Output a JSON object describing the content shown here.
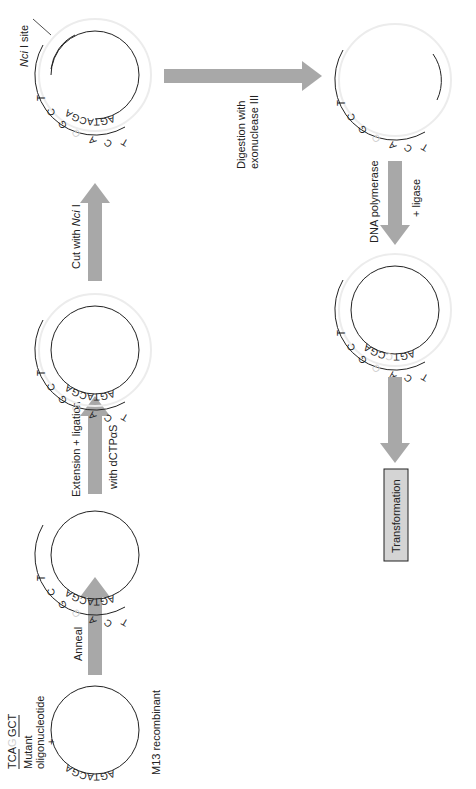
{
  "figure": {
    "type": "site-directed mutagenesis workflow",
    "orientation": "rotated 90deg counter-clockwise",
    "colors": {
      "arrow": "#a8a8a8",
      "strand": "#222222",
      "faded_strand": "#e2e2e2",
      "faded_base": "#cfcfcf",
      "box_fill": "#d4d4d4"
    }
  },
  "oligo": {
    "sequence_left": "TCA",
    "sequence_gap": "G",
    "sequence_right": "GCT",
    "label_line1": "Mutant",
    "label_line2": "oligonucleotide",
    "plus": "+"
  },
  "steps": [
    {
      "id": "m13",
      "template_seq": "AGTACGA",
      "caption": "M13 recombinant"
    },
    {
      "id": "annealed",
      "arrow_label": "Anneal",
      "top_seq": [
        "T",
        "C",
        "A",
        "G",
        "G",
        "C",
        "T"
      ],
      "template_seq": "AGTACGA"
    },
    {
      "id": "extended",
      "arrow_label_line1": "Extension + ligation",
      "arrow_label_line2": "with dCTPαS",
      "top_seq": [
        "T",
        "C",
        "A",
        "G",
        "G",
        "C",
        "T"
      ],
      "template_seq": "AGTACGA"
    },
    {
      "id": "nci-cut",
      "arrow_label_prefix": "Cut with ",
      "arrow_label_enzyme": "Nci",
      "arrow_label_suffix": " I",
      "top_seq": [
        "T",
        "C",
        "A",
        "G",
        "G",
        "C",
        "T"
      ],
      "template_seq": "AGTACGA",
      "site_label_enzyme": "Nci",
      "site_label_suffix": " I site"
    },
    {
      "id": "exo-digested",
      "arrow_label_line1": "Digestion with",
      "arrow_label_line2": "exonuclease III",
      "top_seq": [
        "T",
        "C",
        "A",
        "G",
        "G",
        "C",
        "T"
      ]
    },
    {
      "id": "repaired",
      "arrow_label_line1": "DNA polymerase",
      "arrow_label_line2": "+ ligase",
      "top_seq": [
        "T",
        "C",
        "A",
        "G",
        "G",
        "C",
        "T"
      ],
      "template_seq_left": "AGT",
      "template_seq_mid": "C",
      "template_seq_right": "CGA"
    },
    {
      "id": "transformation",
      "box_label": "Transformation"
    }
  ]
}
